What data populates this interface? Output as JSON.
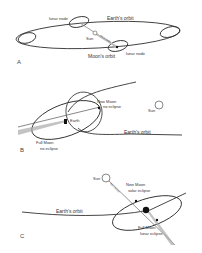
{
  "panels": {
    "a": {
      "letter": "A",
      "earth_orbit": "Earth's orbit",
      "lunar_node_top": "lunar node",
      "lunar_node_bottom": "lunar node",
      "sun": "Sun",
      "moon_orbit": "Moon's orbit",
      "line_of_nodes": "line of nodes"
    },
    "b": {
      "letter": "B",
      "new_moon": "New Moon",
      "new_moon_sub": "no eclipse",
      "sun": "Sun",
      "earth": "Earth",
      "earth_orbit": "Earth's orbit",
      "full_moon": "Full Moon",
      "full_moon_sub": "no eclipse"
    },
    "c": {
      "letter": "C",
      "sun": "Sun",
      "line_of_nodes": "line of nodes",
      "new_moon": "New Moon",
      "new_moon_sub": "solar eclipse",
      "earth_orbit": "Earth's orbit",
      "full_moon": "Full Moon",
      "full_moon_sub": "lunar eclipse"
    }
  },
  "colors": {
    "line": "#333333",
    "shadow": "#aaaaaa",
    "earth": "#111111"
  }
}
